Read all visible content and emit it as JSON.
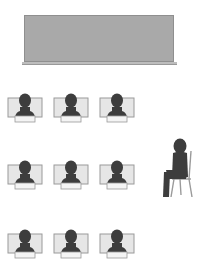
{
  "diagram": {
    "title": "",
    "board": {
      "label": "",
      "color": "#a9a9a9"
    },
    "colors": {
      "person": "#3d3d3d",
      "monitor_fill": "#e6e6e6",
      "monitor_border": "#9a9a9a",
      "chair": "#9a9a9a"
    },
    "students": [
      {
        "row": 1,
        "col": 1
      },
      {
        "row": 1,
        "col": 2
      },
      {
        "row": 1,
        "col": 3
      },
      {
        "row": 2,
        "col": 1
      },
      {
        "row": 2,
        "col": 2
      },
      {
        "row": 2,
        "col": 3
      },
      {
        "row": 3,
        "col": 1
      },
      {
        "row": 3,
        "col": 2
      },
      {
        "row": 3,
        "col": 3
      }
    ],
    "teacher": {
      "position": "right",
      "pose": "seated-on-chair"
    }
  }
}
